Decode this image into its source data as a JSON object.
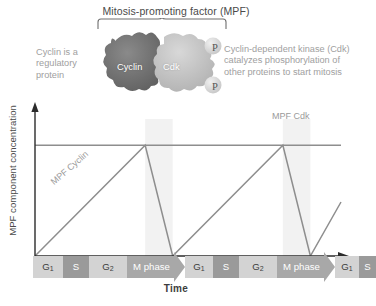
{
  "figure": {
    "title": "Mitosis-promoting factor (MPF)",
    "left_caption": "Cyclin is a regulatory protein",
    "right_caption": "Cyclin-dependent kinase (Cdk) catalyzes phosphorylation of other proteins to start mitosis",
    "blob_labels": {
      "cyclin": "Cyclin",
      "cdk": "Cdk"
    },
    "phosphate_labels": [
      "P",
      "P"
    ],
    "colors": {
      "cyclin_blob": "#6f6f6f",
      "cdk_blob": "#bdbdbd",
      "phase_light": "#d3d3d3",
      "phase_dark": "#9a9a9a",
      "phase_m": "#a8a8a8",
      "curve": "#8e8e8e",
      "axis": "#2b2b2b"
    }
  },
  "chart_data": {
    "type": "line",
    "xlabel": "Time",
    "ylabel": "MPF component concentration",
    "grid": false,
    "legend": "inline-labels",
    "xlim": [
      0,
      100
    ],
    "ylim": [
      0,
      1
    ],
    "annotations": [
      "MPF Cyclin",
      "MPF Cdk"
    ],
    "series": [
      {
        "name": "MPF Cdk",
        "style": "constant",
        "label": "MPF Cdk",
        "x": [
          0,
          100
        ],
        "y": [
          0.82,
          0.82
        ]
      },
      {
        "name": "MPF Cyclin",
        "style": "sawtooth",
        "label": "MPF Cyclin",
        "x": [
          0,
          36,
          45,
          81,
          90,
          100
        ],
        "y": [
          0.0,
          0.82,
          0.0,
          0.82,
          0.0,
          0.4
        ]
      }
    ],
    "phases": [
      {
        "label": "G1",
        "display": "G₁",
        "shape": "box",
        "tone": "light",
        "width": 30
      },
      {
        "label": "S",
        "display": "S",
        "shape": "box",
        "tone": "dark",
        "width": 26
      },
      {
        "label": "G2",
        "display": "G₂",
        "shape": "box",
        "tone": "light",
        "width": 38
      },
      {
        "label": "M phase",
        "display": "M phase",
        "shape": "arrow",
        "tone": "m",
        "width": 58
      },
      {
        "label": "G1",
        "display": "G₁",
        "shape": "box",
        "tone": "light",
        "width": 28
      },
      {
        "label": "S",
        "display": "S",
        "shape": "box",
        "tone": "dark",
        "width": 26
      },
      {
        "label": "G2",
        "display": "G₂",
        "shape": "box",
        "tone": "light",
        "width": 38
      },
      {
        "label": "M phase",
        "display": "M phase",
        "shape": "arrow",
        "tone": "m",
        "width": 58
      },
      {
        "label": "G1",
        "display": "G₁",
        "shape": "box",
        "tone": "light",
        "width": 24
      },
      {
        "label": "S",
        "display": "S",
        "shape": "box",
        "tone": "dark",
        "width": 17
      }
    ]
  }
}
